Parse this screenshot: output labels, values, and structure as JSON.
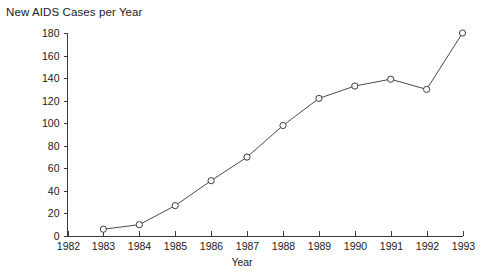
{
  "chart_data": {
    "type": "line",
    "title": "New AIDS Cases per Year",
    "xlabel": "Year",
    "ylabel": "",
    "categories": [
      "1982",
      "1983",
      "1984",
      "1985",
      "1986",
      "1987",
      "1988",
      "1989",
      "1990",
      "1991",
      "1992",
      "1993"
    ],
    "x": [
      1982,
      1983,
      1984,
      1985,
      1986,
      1987,
      1988,
      1989,
      1990,
      1991,
      1992,
      1993
    ],
    "values": [
      null,
      6,
      10,
      27,
      49,
      70,
      98,
      122,
      133,
      139,
      130,
      180
    ],
    "xlim": [
      1982,
      1993
    ],
    "ylim": [
      0,
      180
    ],
    "y_ticks": [
      0,
      20,
      40,
      60,
      80,
      100,
      120,
      140,
      160,
      180
    ],
    "x_ticks": [
      "1982",
      "1983",
      "1984",
      "1985",
      "1986",
      "1987",
      "1988",
      "1989",
      "1990",
      "1991",
      "1992",
      "1993"
    ],
    "grid": false,
    "legend": false,
    "marker": "open-circle",
    "line_color": "#4a4a4a",
    "marker_fill": "#ffffff",
    "marker_stroke": "#3a3a3a",
    "background": "#ffffff"
  }
}
